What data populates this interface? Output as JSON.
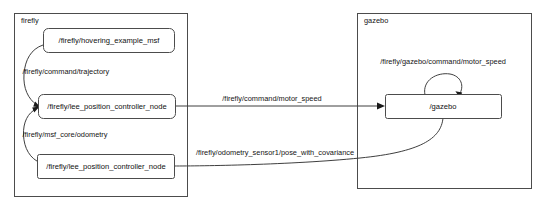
{
  "diagram": {
    "type": "ros-node-graph",
    "background_color": "#ffffff",
    "stroke_color": "#4c4c4c",
    "text_color": "#141414",
    "clusters": [
      {
        "id": "firefly",
        "label": "firefly",
        "nodes": [
          {
            "id": "hovering_example_msf",
            "label": "/firefly/hovering_example_msf"
          },
          {
            "id": "lee_position_controller_node_top",
            "label": "/firefly/lee_position_controller_node"
          },
          {
            "id": "lee_position_controller_node_bottom",
            "label": "/firefly/lee_position_controller_node"
          }
        ]
      },
      {
        "id": "gazebo",
        "label": "gazebo",
        "nodes": [
          {
            "id": "gazebo_node",
            "label": "/gazebo"
          }
        ]
      }
    ],
    "edges": [
      {
        "id": "edge-trajectory",
        "label": "/firefly/command/trajectory",
        "from": "hovering_example_msf",
        "to": "lee_position_controller_node_top"
      },
      {
        "id": "edge-msf-core-odometry",
        "label": "/firefly/msf_core/odometry",
        "from": "lee_position_controller_node_bottom",
        "to": "lee_position_controller_node_top"
      },
      {
        "id": "edge-command-motor-speed",
        "label": "/firefly/command/motor_speed",
        "from": "lee_position_controller_node_top",
        "to": "gazebo_node"
      },
      {
        "id": "edge-gazebo-command-motor-speed",
        "label": "/firefly/gazebo/command/motor_speed",
        "from": "gazebo_node",
        "to": "gazebo_node"
      },
      {
        "id": "edge-pose-with-covariance",
        "label": "/firefly/odometry_sensor1/pose_with_covariance",
        "from": "gazebo_node",
        "to": "lee_position_controller_node_bottom"
      }
    ]
  }
}
